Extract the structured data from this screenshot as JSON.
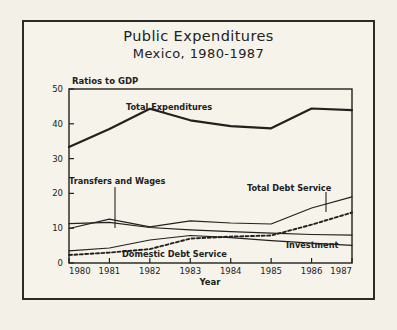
{
  "figure": {
    "title_line_1": "Public Expenditures",
    "title_line_2": "Mexico, 1980-1987",
    "background_color": "#f3f1e7",
    "ink_color": "#22211e"
  },
  "chart_data": {
    "type": "line",
    "title": "Public Expenditures  Mexico, 1980-1987",
    "xlabel": "Year",
    "ylabel": "Ratios to GDP",
    "x": [
      1980,
      1981,
      1982,
      1983,
      1984,
      1985,
      1986,
      1987
    ],
    "xtick_labels": [
      "1980",
      "1981",
      "1982",
      "1983",
      "1984",
      "1985",
      "1986",
      "1987"
    ],
    "ytick_labels": [
      "0",
      "10",
      "20",
      "30",
      "40",
      "50"
    ],
    "ytick_values": [
      0,
      10,
      20,
      30,
      40,
      50
    ],
    "xlim": [
      1980,
      1987
    ],
    "ylim": [
      0,
      50
    ],
    "grid": false,
    "legend": "inline-annotations",
    "series": [
      {
        "name": "Total Expenditures",
        "style": "solid-thick",
        "values": [
          33.3,
          38.5,
          44.3,
          41.0,
          39.3,
          38.7,
          44.4,
          43.9
        ]
      },
      {
        "name": "Transfers and Wages",
        "style": "solid-thin",
        "values": [
          11.3,
          11.7,
          10.2,
          9.5,
          9.0,
          8.6,
          8.2,
          8.0
        ]
      },
      {
        "name": "Total Debt Service",
        "style": "solid-thin",
        "values": [
          9.9,
          12.6,
          10.4,
          12.1,
          11.5,
          11.2,
          15.8,
          19.0
        ]
      },
      {
        "name": "Domestic Debt Service",
        "style": "dotted",
        "values": [
          2.3,
          3.0,
          4.0,
          7.0,
          7.6,
          7.9,
          11.0,
          14.5
        ]
      },
      {
        "name": "Investment",
        "style": "solid-thin",
        "values": [
          3.5,
          4.3,
          6.6,
          7.9,
          7.3,
          6.4,
          5.7,
          5.1
        ]
      }
    ],
    "annotations": [
      {
        "text": "Total Expenditures",
        "for": "Total Expenditures"
      },
      {
        "text": "Transfers and Wages",
        "for": "Transfers and Wages"
      },
      {
        "text": "Total Debt Service",
        "for": "Total Debt Service"
      },
      {
        "text": "Domestic Debt Service",
        "for": "Domestic Debt Service"
      },
      {
        "text": "Investment",
        "for": "Investment"
      }
    ]
  }
}
